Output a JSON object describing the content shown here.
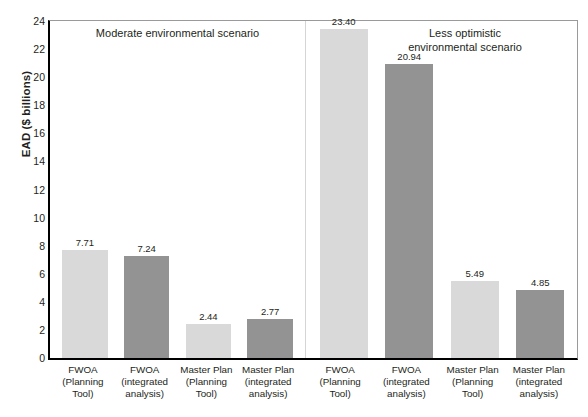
{
  "chart_data": {
    "type": "bar",
    "title": "",
    "xlabel": "",
    "ylabel": "EAD ($ billions)",
    "ylim": [
      0,
      24
    ],
    "yticks": [
      0,
      2,
      4,
      6,
      8,
      10,
      12,
      14,
      16,
      18,
      20,
      22,
      24
    ],
    "grid": false,
    "legend": "none",
    "panels": [
      {
        "title": "Moderate environmental scenario",
        "title_lines": [
          "Moderate environmental scenario"
        ],
        "categories": [
          "FWOA (Planning Tool)",
          "FWOA (integrated analysis)",
          "Master Plan (Planning Tool)",
          "Master Plan (integrated analysis)"
        ],
        "category_lines": [
          [
            "FWOA",
            "(Planning",
            "Tool)"
          ],
          [
            "FWOA",
            "(integrated",
            "analysis)"
          ],
          [
            "Master Plan",
            "(Planning",
            "Tool)"
          ],
          [
            "Master Plan",
            "(integrated",
            "analysis)"
          ]
        ],
        "values": [
          7.71,
          7.24,
          2.44,
          2.77
        ],
        "value_labels": [
          "7.71",
          "7.24",
          "2.44",
          "2.77"
        ],
        "shades": [
          "light",
          "dark",
          "light",
          "dark"
        ]
      },
      {
        "title": "Less optimistic environmental scenario",
        "title_lines": [
          "Less optimistic",
          "environmental scenario"
        ],
        "categories": [
          "FWOA (Planning Tool)",
          "FWOA (integrated analysis)",
          "Master Plan (Planning Tool)",
          "Master Plan (integrated analysis)"
        ],
        "category_lines": [
          [
            "FWOA",
            "(Planning",
            "Tool)"
          ],
          [
            "FWOA",
            "(integrated",
            "analysis)"
          ],
          [
            "Master Plan",
            "(Planning",
            "Tool)"
          ],
          [
            "Master Plan",
            "(integrated",
            "analysis)"
          ]
        ],
        "values": [
          23.4,
          20.94,
          5.49,
          4.85
        ],
        "value_labels": [
          "23.40",
          "20.94",
          "5.49",
          "4.85"
        ],
        "shades": [
          "light",
          "dark",
          "light",
          "dark"
        ]
      }
    ]
  },
  "colors": {
    "light_bar": "#d9d9d9",
    "dark_bar": "#939393",
    "axis": "#000000",
    "frame": "#9a9a9a",
    "text": "#231f20"
  }
}
